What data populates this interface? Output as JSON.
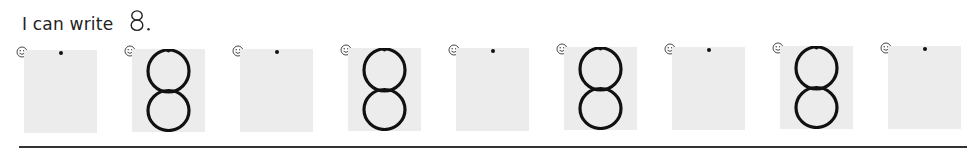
{
  "worksheet": {
    "heading": {
      "text": "I can write",
      "digit": "8",
      "punctuation": "."
    },
    "practice_digit": "8",
    "colors": {
      "box_fill": "#ececec",
      "stroke": "#111111",
      "rule": "#333333"
    },
    "cells": [
      {
        "index": 1,
        "type": "blank-with-start-dot",
        "icon": "smiley-icon"
      },
      {
        "index": 2,
        "type": "traced-digit",
        "digit": "8",
        "icon": "smiley-icon"
      },
      {
        "index": 3,
        "type": "blank-with-start-dot",
        "icon": "smiley-icon"
      },
      {
        "index": 4,
        "type": "traced-digit",
        "digit": "8",
        "icon": "smiley-icon"
      },
      {
        "index": 5,
        "type": "blank-with-start-dot",
        "icon": "smiley-icon"
      },
      {
        "index": 6,
        "type": "traced-digit",
        "digit": "8",
        "icon": "smiley-icon"
      },
      {
        "index": 7,
        "type": "blank-with-start-dot",
        "icon": "smiley-icon"
      },
      {
        "index": 8,
        "type": "traced-digit",
        "digit": "8",
        "icon": "smiley-icon"
      },
      {
        "index": 9,
        "type": "blank-with-start-dot",
        "icon": "smiley-icon"
      }
    ]
  }
}
